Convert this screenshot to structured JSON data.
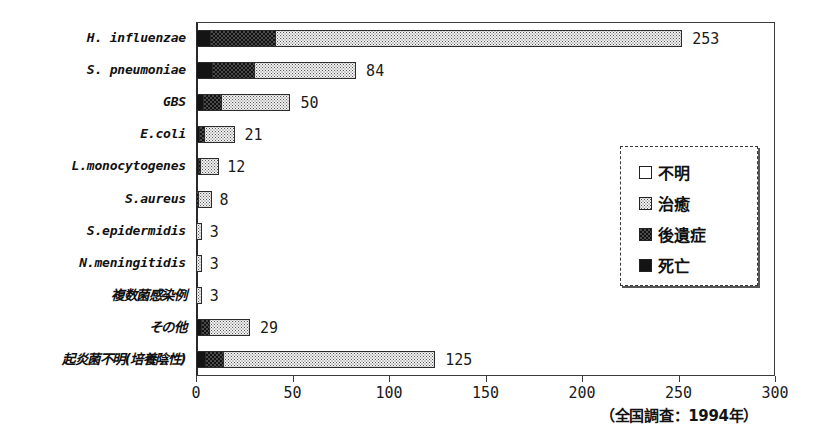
{
  "chart_data": {
    "type": "bar",
    "orientation": "horizontal",
    "stacked": true,
    "title": "",
    "subtitle": "",
    "xlabel": "",
    "ylabel": "",
    "xlim": [
      0,
      300
    ],
    "xticks": [
      0,
      50,
      100,
      150,
      200,
      250,
      300
    ],
    "xticklabels": [
      "0",
      "50",
      "100",
      "150",
      "200",
      "250",
      "300"
    ],
    "grid": false,
    "legend_position": "inside-right",
    "legend": [
      "不明",
      "治癒",
      "後遺症",
      "死亡"
    ],
    "series": [
      {
        "name": "死亡",
        "values": [
          8,
          9,
          4,
          2,
          1,
          0,
          0,
          0,
          0,
          3,
          5
        ]
      },
      {
        "name": "後遺症",
        "values": [
          34,
          22,
          10,
          3,
          1,
          1,
          0,
          0,
          0,
          5,
          10
        ]
      },
      {
        "name": "治癒",
        "values": [
          211,
          53,
          36,
          16,
          10,
          7,
          3,
          3,
          3,
          21,
          110
        ]
      },
      {
        "name": "不明",
        "values": [
          0,
          0,
          0,
          0,
          0,
          0,
          0,
          0,
          0,
          0,
          0
        ]
      }
    ],
    "categories": [
      "H. influenzae",
      "S. pneumoniae",
      "GBS",
      "E.coli",
      "L.monocytogenes",
      "S.aureus",
      "S.epidermidis",
      "N.meningitidis",
      "複数菌感染例",
      "その他",
      "起炎菌不明(培養陰性)"
    ],
    "totals": [
      253,
      84,
      50,
      21,
      12,
      8,
      3,
      3,
      3,
      29,
      125
    ],
    "annotation": "（全国調査：1994年）"
  },
  "rows": [
    {
      "label": "H. influenzae",
      "jp": false,
      "total": 253,
      "total_text": "253",
      "death": 8,
      "sequelae": 34,
      "cured": 211
    },
    {
      "label": "S. pneumoniae",
      "jp": false,
      "total": 84,
      "total_text": "84",
      "death": 9,
      "sequelae": 22,
      "cured": 53
    },
    {
      "label": "GBS",
      "jp": false,
      "total": 50,
      "total_text": "50",
      "death": 4,
      "sequelae": 10,
      "cured": 36
    },
    {
      "label": "E.coli",
      "jp": false,
      "total": 21,
      "total_text": "21",
      "death": 2,
      "sequelae": 3,
      "cured": 16
    },
    {
      "label": "L.monocytogenes",
      "jp": false,
      "total": 12,
      "total_text": "12",
      "death": 1,
      "sequelae": 1,
      "cured": 10
    },
    {
      "label": "S.aureus",
      "jp": false,
      "total": 8,
      "total_text": "8",
      "death": 0,
      "sequelae": 1,
      "cured": 7
    },
    {
      "label": "S.epidermidis",
      "jp": false,
      "total": 3,
      "total_text": "3",
      "death": 0,
      "sequelae": 0,
      "cured": 3
    },
    {
      "label": "N.meningitidis",
      "jp": false,
      "total": 3,
      "total_text": "3",
      "death": 0,
      "sequelae": 0,
      "cured": 3
    },
    {
      "label": "複数菌感染例",
      "jp": true,
      "total": 3,
      "total_text": "3",
      "death": 0,
      "sequelae": 0,
      "cured": 3
    },
    {
      "label": "その他",
      "jp": true,
      "total": 29,
      "total_text": "29",
      "death": 3,
      "sequelae": 5,
      "cured": 21
    },
    {
      "label": "起炎菌不明(培養陰性)",
      "jp": true,
      "total": 125,
      "total_text": "125",
      "death": 5,
      "sequelae": 10,
      "cured": 110
    }
  ],
  "axis": {
    "ticks": [
      "0",
      "50",
      "100",
      "150",
      "200",
      "250",
      "300"
    ],
    "tick_values": [
      0,
      50,
      100,
      150,
      200,
      250,
      300
    ],
    "max": 300
  },
  "legend": {
    "items": [
      {
        "label": "不明",
        "pattern": "unknown"
      },
      {
        "label": "治癒",
        "pattern": "cured"
      },
      {
        "label": "後遺症",
        "pattern": "sequelae"
      },
      {
        "label": "死亡",
        "pattern": "death"
      }
    ]
  },
  "caption": {
    "text": "（全国調査：1994年）"
  },
  "colors": {
    "death": "#141414",
    "sequelae": "#4a4a4a",
    "cured": "#f2f2f2",
    "unknown": "#ffffff",
    "axis": "#3a3a3a",
    "text": "#141414"
  }
}
